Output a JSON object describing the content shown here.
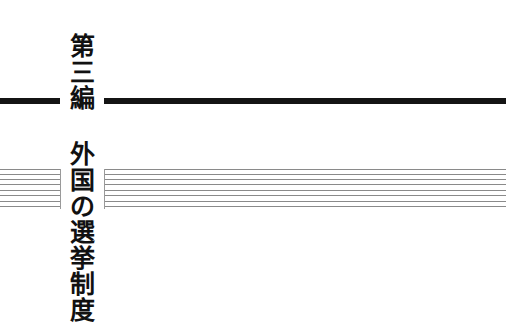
{
  "part_label": [
    "第",
    "三",
    "編"
  ],
  "title": [
    "外",
    "国",
    "の",
    "選",
    "挙",
    "制",
    "度"
  ],
  "colors": {
    "rule": "#141414",
    "thin_rule": "#8a8a8a",
    "text": "#111111",
    "background": "#ffffff"
  },
  "thin_line_count": 8
}
